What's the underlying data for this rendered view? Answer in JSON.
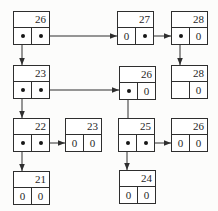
{
  "diagram": {
    "type": "linked-node-structure",
    "background_color": "#fcfcfb",
    "node_fill_color": "#ffffff",
    "line_color": "#2e2e2e",
    "text_color": "#1f1f1f",
    "null_symbol": "0",
    "node_size": {
      "width": 37,
      "height": 34,
      "key_cell_height": 16
    },
    "nodes": [
      {
        "id": "26-root",
        "key": "26",
        "x": 13,
        "y": 11,
        "left": "ptr",
        "right": "ptr"
      },
      {
        "id": "27-root",
        "key": "27",
        "x": 117,
        "y": 11,
        "left": "0",
        "right": "ptr"
      },
      {
        "id": "28-root",
        "key": "28",
        "x": 171,
        "y": 11,
        "left": "ptr",
        "right": "0"
      },
      {
        "id": "23-mid",
        "key": "23",
        "x": 13,
        "y": 65,
        "left": "ptr",
        "right": "ptr"
      },
      {
        "id": "26-mid",
        "key": "26",
        "x": 119,
        "y": 66,
        "left": "ptr",
        "right": "0"
      },
      {
        "id": "28-child",
        "key": "28",
        "x": 171,
        "y": 65,
        "left": "",
        "right": "0"
      },
      {
        "id": "22",
        "key": "22",
        "x": 13,
        "y": 118,
        "left": "ptr",
        "right": "ptr"
      },
      {
        "id": "23-leaf",
        "key": "23",
        "x": 65,
        "y": 118,
        "left": "0",
        "right": "0"
      },
      {
        "id": "25",
        "key": "25",
        "x": 118,
        "y": 118,
        "left": "ptr",
        "right": "ptr"
      },
      {
        "id": "26-leaf",
        "key": "26",
        "x": 171,
        "y": 118,
        "left": "0",
        "right": "0"
      },
      {
        "id": "21",
        "key": "21",
        "x": 13,
        "y": 171,
        "left": "0",
        "right": "0"
      },
      {
        "id": "24",
        "key": "24",
        "x": 119,
        "y": 170,
        "left": "0",
        "right": "0"
      }
    ],
    "arrows": [
      {
        "name": "26-root-right-to-27",
        "x1": 41,
        "y1": 36,
        "x2": 117,
        "y2": 36,
        "head": "right"
      },
      {
        "name": "26-root-left-to-23",
        "x1": 22,
        "y1": 36,
        "x2": 22,
        "y2": 65,
        "head": "down"
      },
      {
        "name": "27-right-to-28",
        "x1": 145,
        "y1": 36,
        "x2": 171,
        "y2": 36,
        "head": "right"
      },
      {
        "name": "28-root-left-to-28",
        "x1": 180,
        "y1": 36,
        "x2": 180,
        "y2": 65,
        "head": "down"
      },
      {
        "name": "23-mid-left-to-22",
        "x1": 22,
        "y1": 90,
        "x2": 22,
        "y2": 118,
        "head": "down"
      },
      {
        "name": "23-mid-right-to-26",
        "x1": 41,
        "y1": 90,
        "x2": 119,
        "y2": 90,
        "head": "right"
      },
      {
        "name": "26-mid-left-to-25",
        "x1": 128,
        "y1": 91,
        "x2": 128,
        "y2": 118,
        "head": "none"
      },
      {
        "name": "22-left-to-21",
        "x1": 22,
        "y1": 143,
        "x2": 22,
        "y2": 171,
        "head": "down"
      },
      {
        "name": "22-right-to-23",
        "x1": 41,
        "y1": 143,
        "x2": 65,
        "y2": 143,
        "head": "right"
      },
      {
        "name": "25-left-to-24",
        "x1": 127,
        "y1": 143,
        "x2": 127,
        "y2": 170,
        "head": "down"
      },
      {
        "name": "25-right-to-26",
        "x1": 145,
        "y1": 143,
        "x2": 171,
        "y2": 143,
        "head": "right"
      }
    ]
  }
}
